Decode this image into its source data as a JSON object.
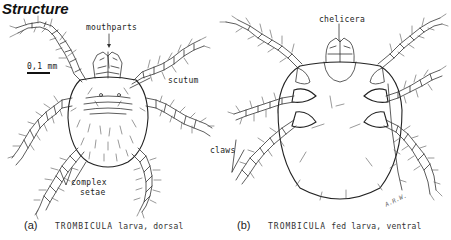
{
  "title": "Structure",
  "scale_bar": {
    "label": "0,1 mm"
  },
  "figure_a": {
    "letter": "(a)",
    "genus": "TROMBICULA",
    "description": "larva, dorsal",
    "labels": {
      "mouthparts": "mouthparts",
      "scutum": "scutum",
      "complex": "complex",
      "setae": "setae"
    }
  },
  "figure_b": {
    "letter": "(b)",
    "genus": "TROMBICULA",
    "description": "fed larva, ventral",
    "labels": {
      "chelicera": "chelicera",
      "claws": "claws"
    },
    "signature": "A.R.W."
  }
}
